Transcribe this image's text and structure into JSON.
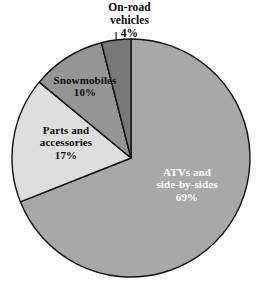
{
  "background_color": "#fdfdfd",
  "outline_color": "#111111",
  "geometry": {
    "center_x": 131,
    "center_y": 158,
    "radius": 119
  },
  "chart_data": {
    "type": "pie",
    "title": "",
    "subtitle": "",
    "xlabel": "",
    "ylabel": "",
    "legend_position": "none",
    "grid": false,
    "units": "percent",
    "start_angle_deg": 0,
    "direction": "clockwise",
    "categories": [
      "ATVs and side-by-sides",
      "Parts and accessories",
      "Snowmobiles",
      "On-road vehicles"
    ],
    "values": [
      69,
      17,
      10,
      4
    ],
    "slices": [
      {
        "label": "ATVs and side-by-sides",
        "label_line1": "ATVs and",
        "label_line2": "side-by-sides",
        "value": 69,
        "value_text": "69%",
        "color": "#a8a8a8",
        "label_color": "#ffffff",
        "label_placement": "inside"
      },
      {
        "label": "Parts and accessories",
        "label_line1": "Parts and",
        "label_line2": "accessories",
        "value": 17,
        "value_text": "17%",
        "color": "#dedede",
        "label_color": "#0b0b0b",
        "label_placement": "inside"
      },
      {
        "label": "Snowmobiles",
        "label_line1": "Snowmobiles",
        "label_line2": "",
        "value": 10,
        "value_text": "10%",
        "color": "#959595",
        "label_color": "#0b0b0b",
        "label_placement": "inside"
      },
      {
        "label": "On-road vehicles",
        "label_line1": "On-road",
        "label_line2": "vehicles",
        "value": 4,
        "value_text": "4%",
        "color": "#787878",
        "label_color": "#0b0b0b",
        "label_placement": "outside-top"
      }
    ]
  }
}
